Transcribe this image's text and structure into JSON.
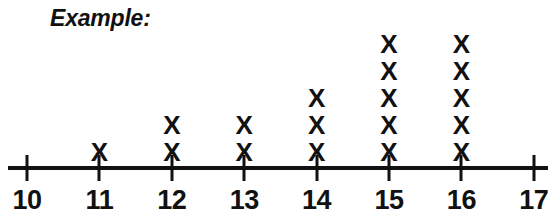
{
  "title": "Example:",
  "axis": {
    "min": 10,
    "max": 17,
    "tick_labels": [
      "10",
      "11",
      "12",
      "13",
      "14",
      "15",
      "16",
      "17"
    ]
  },
  "mark_glyph": "X",
  "colors": {
    "ink": "#111111",
    "background": "#ffffff"
  },
  "chart_data": {
    "type": "scatter",
    "plot_style": "dot-plot",
    "title": "Example:",
    "xlabel": "",
    "ylabel": "",
    "categories": [
      "10",
      "11",
      "12",
      "13",
      "14",
      "15",
      "16",
      "17"
    ],
    "x": [
      10,
      11,
      12,
      13,
      14,
      15,
      16,
      17
    ],
    "values": [
      0,
      1,
      2,
      2,
      3,
      5,
      5,
      0
    ],
    "marker": "X",
    "xlim": [
      10,
      17
    ],
    "ylim": [
      0,
      5
    ],
    "grid": false,
    "legend": false
  }
}
